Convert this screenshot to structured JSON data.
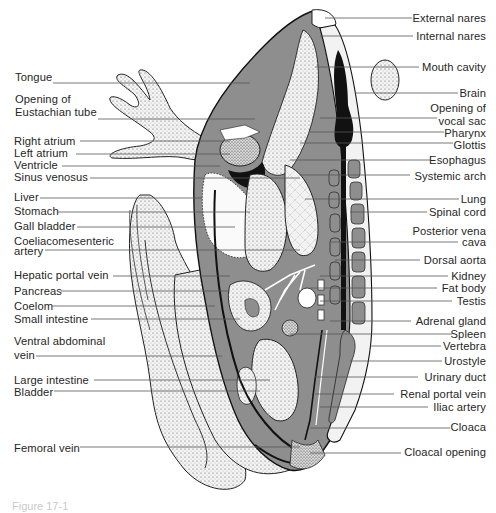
{
  "figure": {
    "caption_partial": "Figure 17-1"
  },
  "colors": {
    "background": "#ffffff",
    "body_gray": "#8e8e8e",
    "dark": "#111111",
    "stipple": "#cfcfcf",
    "leader_line": "#555555",
    "text": "#262626"
  },
  "labels_left": [
    {
      "text": "Tongue",
      "x": 15,
      "y": 76,
      "line_to": 250
    },
    {
      "text": "Opening of",
      "x": 15,
      "y": 99
    },
    {
      "text": "Eustachian tube",
      "x": 15,
      "y": 112,
      "line_to": 255
    },
    {
      "text": "Right atrium",
      "x": 14,
      "y": 134,
      "line_to": 230
    },
    {
      "text": "Left atrium",
      "x": 14,
      "y": 147,
      "line_to": 230
    },
    {
      "text": "Ventricle",
      "x": 14,
      "y": 159,
      "line_to": 220
    },
    {
      "text": "Sinus venosus",
      "x": 14,
      "y": 172,
      "line_to": 300
    },
    {
      "text": "Liver",
      "x": 14,
      "y": 192,
      "line_to": 202
    },
    {
      "text": "Stomach",
      "x": 14,
      "y": 207,
      "line_to": 250
    },
    {
      "text": "Gall bladder",
      "x": 14,
      "y": 223,
      "line_to": 235
    },
    {
      "text": "Coeliacomesenteric",
      "x": 14,
      "y": 239
    },
    {
      "text": "artery",
      "x": 14,
      "y": 250,
      "line_to": 300
    },
    {
      "text": "Hepatic portal vein",
      "x": 14,
      "y": 272,
      "line_to": 230
    },
    {
      "text": "Pancreas",
      "x": 14,
      "y": 287,
      "line_to": 230
    },
    {
      "text": "Coelom",
      "x": 14,
      "y": 303,
      "line_to": 215
    },
    {
      "text": "Small intestine",
      "x": 14,
      "y": 318,
      "line_to": 240
    },
    {
      "text": "Ventral abdominal",
      "x": 14,
      "y": 340
    },
    {
      "text": "vein",
      "x": 14,
      "y": 355,
      "line_to": 222
    },
    {
      "text": "Large intestine",
      "x": 14,
      "y": 379,
      "line_to": 270
    },
    {
      "text": "Bladder",
      "x": 14,
      "y": 392,
      "line_to": 260
    },
    {
      "text": "Femoral vein",
      "x": 14,
      "y": 447,
      "line_to": 300
    }
  ],
  "labels_right": [
    {
      "text": "External nares",
      "right": 486,
      "y": 17,
      "line_from": 325
    },
    {
      "text": "Internal nares",
      "right": 486,
      "y": 35,
      "line_from": 320
    },
    {
      "text": "Mouth cavity",
      "right": 486,
      "y": 66,
      "line_from": 315
    },
    {
      "text": "Brain",
      "right": 486,
      "y": 92,
      "line_from": 355
    },
    {
      "text": "Opening of",
      "right": 486,
      "y": 108
    },
    {
      "text": "vocal sac",
      "right": 486,
      "y": 121,
      "line_from": 320
    },
    {
      "text": "Pharynx",
      "right": 486,
      "y": 133,
      "line_from": 310
    },
    {
      "text": "Glottis",
      "right": 486,
      "y": 145,
      "line_from": 300
    },
    {
      "text": "Esophagus",
      "right": 486,
      "y": 160,
      "line_from": 290
    },
    {
      "text": "Systemic arch",
      "right": 486,
      "y": 176,
      "line_from": 300
    },
    {
      "text": "Lung",
      "right": 486,
      "y": 199,
      "line_from": 305
    },
    {
      "text": "Spinal cord",
      "right": 486,
      "y": 212,
      "line_from": 350
    },
    {
      "text": "Posterior vena",
      "right": 486,
      "y": 231
    },
    {
      "text": "cava",
      "right": 486,
      "y": 242,
      "line_from": 330
    },
    {
      "text": "Dorsal aorta",
      "right": 486,
      "y": 260,
      "line_from": 335
    },
    {
      "text": "Kidney",
      "right": 486,
      "y": 276,
      "line_from": 320
    },
    {
      "text": "Fat body",
      "right": 486,
      "y": 288,
      "line_from": 310
    },
    {
      "text": "Testis",
      "right": 486,
      "y": 300,
      "line_from": 320
    },
    {
      "text": "Adrenal gland",
      "right": 486,
      "y": 321,
      "line_from": 330
    },
    {
      "text": "Spleen",
      "right": 486,
      "y": 334,
      "line_from": 290
    },
    {
      "text": "Vertebra",
      "right": 486,
      "y": 346,
      "line_from": 370
    },
    {
      "text": "Urostyle",
      "right": 486,
      "y": 361,
      "line_from": 350
    },
    {
      "text": "Urinary duct",
      "right": 486,
      "y": 377,
      "line_from": 315
    },
    {
      "text": "Renal portal vein",
      "right": 486,
      "y": 394,
      "line_from": 315
    },
    {
      "text": "Iliac artery",
      "right": 486,
      "y": 407,
      "line_from": 320
    },
    {
      "text": "Cloaca",
      "right": 486,
      "y": 427,
      "line_from": 310
    },
    {
      "text": "Cloacal opening",
      "right": 486,
      "y": 452,
      "line_from": 310
    }
  ]
}
